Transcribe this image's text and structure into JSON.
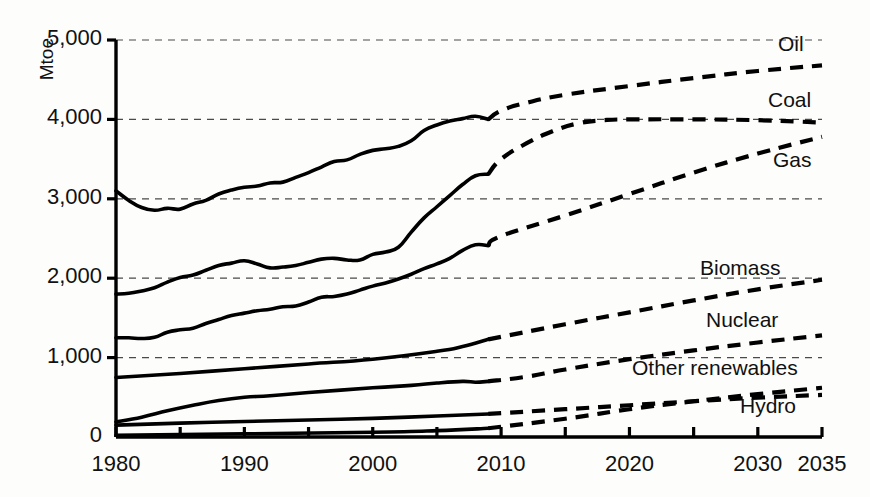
{
  "chart_data": {
    "type": "line",
    "title": "",
    "subtitle": "",
    "xlabel": "",
    "ylabel": "Mtoe",
    "unit_label": "Mtoe",
    "xlim": [
      1980,
      2035
    ],
    "ylim": [
      0,
      5000
    ],
    "grid": "horizontal-dashed",
    "legend_position": "right-inline-labels",
    "projection_start_year": 2009,
    "ytick_labels": [
      "0",
      "1,000",
      "2,000",
      "3,000",
      "4,000",
      "5,000"
    ],
    "ytick_values": [
      0,
      1000,
      2000,
      3000,
      4000,
      5000
    ],
    "xtick_labels": [
      "1980",
      "1990",
      "2000",
      "2010",
      "2020",
      "2030",
      "2035"
    ],
    "xtick_values": [
      1980,
      1990,
      2000,
      2010,
      2020,
      2030,
      2035
    ],
    "xminor_tick_values": [
      1985,
      1995,
      2005,
      2015,
      2025
    ],
    "series": [
      {
        "name": "Oil",
        "label": "Oil",
        "color": "#000000",
        "history": [
          [
            1980,
            3100
          ],
          [
            1981,
            2980
          ],
          [
            1982,
            2890
          ],
          [
            1983,
            2855
          ],
          [
            1984,
            2880
          ],
          [
            1985,
            2870
          ],
          [
            1986,
            2935
          ],
          [
            1987,
            2980
          ],
          [
            1988,
            3060
          ],
          [
            1989,
            3110
          ],
          [
            1990,
            3145
          ],
          [
            1991,
            3160
          ],
          [
            1992,
            3200
          ],
          [
            1993,
            3210
          ],
          [
            1994,
            3270
          ],
          [
            1995,
            3330
          ],
          [
            1996,
            3400
          ],
          [
            1997,
            3470
          ],
          [
            1998,
            3490
          ],
          [
            1999,
            3560
          ],
          [
            2000,
            3610
          ],
          [
            2001,
            3630
          ],
          [
            2002,
            3660
          ],
          [
            2003,
            3730
          ],
          [
            2004,
            3860
          ],
          [
            2005,
            3930
          ],
          [
            2006,
            3980
          ],
          [
            2007,
            4010
          ],
          [
            2008,
            4040
          ],
          [
            2009,
            4000
          ]
        ],
        "projection": [
          [
            2009,
            4000
          ],
          [
            2010,
            4110
          ],
          [
            2012,
            4210
          ],
          [
            2015,
            4310
          ],
          [
            2020,
            4420
          ],
          [
            2025,
            4520
          ],
          [
            2030,
            4610
          ],
          [
            2035,
            4680
          ]
        ]
      },
      {
        "name": "Coal",
        "label": "Coal",
        "color": "#000000",
        "history": [
          [
            1980,
            1800
          ],
          [
            1981,
            1810
          ],
          [
            1982,
            1840
          ],
          [
            1983,
            1880
          ],
          [
            1984,
            1950
          ],
          [
            1985,
            2010
          ],
          [
            1986,
            2040
          ],
          [
            1987,
            2100
          ],
          [
            1988,
            2160
          ],
          [
            1989,
            2190
          ],
          [
            1990,
            2220
          ],
          [
            1991,
            2180
          ],
          [
            1992,
            2130
          ],
          [
            1993,
            2140
          ],
          [
            1994,
            2160
          ],
          [
            1995,
            2200
          ],
          [
            1996,
            2240
          ],
          [
            1997,
            2250
          ],
          [
            1998,
            2230
          ],
          [
            1999,
            2230
          ],
          [
            2000,
            2300
          ],
          [
            2001,
            2330
          ],
          [
            2002,
            2390
          ],
          [
            2003,
            2580
          ],
          [
            2004,
            2760
          ],
          [
            2005,
            2900
          ],
          [
            2006,
            3040
          ],
          [
            2007,
            3180
          ],
          [
            2008,
            3290
          ],
          [
            2009,
            3310
          ]
        ],
        "projection": [
          [
            2009,
            3310
          ],
          [
            2010,
            3500
          ],
          [
            2012,
            3700
          ],
          [
            2014,
            3850
          ],
          [
            2016,
            3950
          ],
          [
            2018,
            3990
          ],
          [
            2020,
            4000
          ],
          [
            2025,
            4000
          ],
          [
            2030,
            3990
          ],
          [
            2035,
            3960
          ]
        ]
      },
      {
        "name": "Gas",
        "label": "Gas",
        "color": "#000000",
        "history": [
          [
            1980,
            1250
          ],
          [
            1981,
            1250
          ],
          [
            1982,
            1240
          ],
          [
            1983,
            1255
          ],
          [
            1984,
            1320
          ],
          [
            1985,
            1350
          ],
          [
            1986,
            1370
          ],
          [
            1987,
            1430
          ],
          [
            1988,
            1480
          ],
          [
            1989,
            1530
          ],
          [
            1990,
            1560
          ],
          [
            1991,
            1590
          ],
          [
            1992,
            1610
          ],
          [
            1993,
            1640
          ],
          [
            1994,
            1650
          ],
          [
            1995,
            1700
          ],
          [
            1996,
            1760
          ],
          [
            1997,
            1770
          ],
          [
            1998,
            1800
          ],
          [
            1999,
            1850
          ],
          [
            2000,
            1900
          ],
          [
            2001,
            1940
          ],
          [
            2002,
            1990
          ],
          [
            2003,
            2050
          ],
          [
            2004,
            2120
          ],
          [
            2005,
            2180
          ],
          [
            2006,
            2250
          ],
          [
            2007,
            2350
          ],
          [
            2008,
            2420
          ],
          [
            2009,
            2410
          ]
        ],
        "projection": [
          [
            2009,
            2410
          ],
          [
            2010,
            2530
          ],
          [
            2015,
            2790
          ],
          [
            2020,
            3060
          ],
          [
            2025,
            3330
          ],
          [
            2030,
            3570
          ],
          [
            2035,
            3780
          ]
        ]
      },
      {
        "name": "Biomass",
        "label": "Biomass",
        "color": "#000000",
        "history": [
          [
            1980,
            750
          ],
          [
            1985,
            800
          ],
          [
            1990,
            860
          ],
          [
            1995,
            920
          ],
          [
            2000,
            980
          ],
          [
            2005,
            1080
          ],
          [
            2007,
            1140
          ],
          [
            2009,
            1230
          ]
        ],
        "projection": [
          [
            2009,
            1230
          ],
          [
            2015,
            1420
          ],
          [
            2020,
            1570
          ],
          [
            2025,
            1720
          ],
          [
            2030,
            1860
          ],
          [
            2035,
            1980
          ]
        ]
      },
      {
        "name": "Nuclear",
        "label": "Nuclear",
        "color": "#000000",
        "history": [
          [
            1980,
            190
          ],
          [
            1982,
            250
          ],
          [
            1984,
            330
          ],
          [
            1986,
            400
          ],
          [
            1988,
            460
          ],
          [
            1990,
            500
          ],
          [
            1992,
            520
          ],
          [
            1995,
            560
          ],
          [
            2000,
            620
          ],
          [
            2003,
            650
          ],
          [
            2005,
            680
          ],
          [
            2007,
            700
          ],
          [
            2008,
            690
          ],
          [
            2009,
            700
          ]
        ],
        "projection": [
          [
            2009,
            700
          ],
          [
            2012,
            760
          ],
          [
            2015,
            850
          ],
          [
            2020,
            980
          ],
          [
            2025,
            1090
          ],
          [
            2030,
            1190
          ],
          [
            2035,
            1280
          ]
        ]
      },
      {
        "name": "Other renewables",
        "label": "Other renewables",
        "color": "#000000",
        "history": [
          [
            1980,
            20
          ],
          [
            1990,
            40
          ],
          [
            2000,
            60
          ],
          [
            2005,
            80
          ],
          [
            2009,
            110
          ]
        ],
        "projection": [
          [
            2009,
            110
          ],
          [
            2015,
            230
          ],
          [
            2020,
            350
          ],
          [
            2025,
            450
          ],
          [
            2030,
            540
          ],
          [
            2035,
            620
          ]
        ]
      },
      {
        "name": "Hydro",
        "label": "Hydro",
        "color": "#000000",
        "history": [
          [
            1980,
            150
          ],
          [
            1985,
            175
          ],
          [
            1990,
            195
          ],
          [
            1995,
            215
          ],
          [
            2000,
            235
          ],
          [
            2005,
            265
          ],
          [
            2009,
            290
          ]
        ],
        "projection": [
          [
            2009,
            290
          ],
          [
            2015,
            350
          ],
          [
            2020,
            400
          ],
          [
            2025,
            450
          ],
          [
            2030,
            495
          ],
          [
            2035,
            530
          ]
        ]
      }
    ]
  },
  "labels": {
    "unit": "Mtoe",
    "oil": "Oil",
    "coal": "Coal",
    "gas": "Gas",
    "biomass": "Biomass",
    "nuclear": "Nuclear",
    "other_renewables": "Other renewables",
    "hydro": "Hydro",
    "y0": "0",
    "y1000": "1,000",
    "y2000": "2,000",
    "y3000": "3,000",
    "y4000": "4,000",
    "y5000": "5,000",
    "x1980": "1980",
    "x1990": "1990",
    "x2000": "2000",
    "x2010": "2010",
    "x2020": "2020",
    "x2030": "2030",
    "x2035": "2035"
  }
}
